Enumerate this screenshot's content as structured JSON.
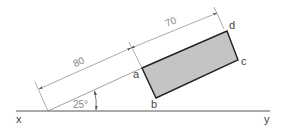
{
  "diagram": {
    "type": "orthographic-projection",
    "colors": {
      "line": "#222222",
      "thin_line": "#8a8a8a",
      "fill": "#c4c4c4",
      "text": "#444444"
    },
    "reference_line": {
      "left_label": "x",
      "right_label": "y"
    },
    "shape": {
      "corners": [
        "a",
        "b",
        "c",
        "d"
      ],
      "labels": {
        "a": "a",
        "b": "b",
        "c": "c",
        "d": "d"
      }
    },
    "dimensions": {
      "distance_to_a": "80",
      "length_ad": "70",
      "angle": "25°"
    }
  }
}
